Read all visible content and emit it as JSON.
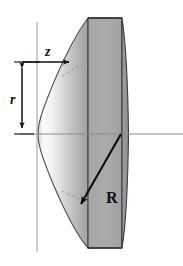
{
  "figure": {
    "type": "optical-lens-cross-section",
    "canvas": {
      "width": 183,
      "height": 266,
      "background": "#ffffff"
    },
    "labels": {
      "sag_axial": "z",
      "radial_height": "r",
      "radius_of_curvature": "R"
    },
    "colors": {
      "lens_body_light": "#f2f2f2",
      "lens_body_mid": "#b4b4b4",
      "lens_body_dark": "#9a9a9a",
      "lens_column": "#a8a8a8",
      "outline": "#3a3a3a",
      "axis": "#8e8e8e",
      "arrow": "#111111",
      "dashed_tangent": "#7a7a7a",
      "label_text": "#111111"
    },
    "geometry": {
      "origin": {
        "x": 37,
        "y": 134
      },
      "vertex": {
        "x": 38,
        "y": 134
      },
      "vertical_axis_x": 37,
      "horizontal_axis_y": 134,
      "lens_top_y": 18,
      "lens_bottom_y": 248,
      "column_left_x": 88,
      "column_right_x": 122,
      "z_arrow": {
        "x1": 22,
        "y1": 62,
        "x2": 71,
        "y2": 62
      },
      "r_arrow": {
        "x": 22,
        "y1": 62,
        "y2": 134
      },
      "R_arrow": {
        "x1": 121,
        "y1": 134,
        "x2": 79,
        "y2": 207
      }
    },
    "annotations": [
      {
        "name": "sag-arrow",
        "label": "z",
        "kind": "single-headed-horizontal-arrow"
      },
      {
        "name": "height-arrow",
        "label": "r",
        "kind": "double-headed-vertical-arrow"
      },
      {
        "name": "radius-arrow",
        "label": "R",
        "kind": "single-headed-diagonal-arrow"
      },
      {
        "name": "tangent-upper",
        "label": "",
        "kind": "dashed-segment"
      },
      {
        "name": "tangent-lower",
        "label": "",
        "kind": "dashed-segment"
      }
    ]
  }
}
